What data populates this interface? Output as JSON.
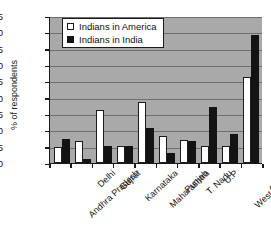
{
  "chart_data": {
    "type": "bar",
    "title": "",
    "xlabel": "",
    "ylabel": "% of respondents",
    "ylim": [
      0,
      45
    ],
    "ytick_step": 5,
    "yticks": [
      "45",
      "40",
      "35",
      "30",
      "25",
      "20",
      "15",
      "10",
      "5",
      "0"
    ],
    "grid": true,
    "legend_position": "top-left-inside",
    "categories": [
      "Andhra Pradesh",
      "Delhi",
      "Gujrat",
      "Karnataka",
      "Maharashtra",
      "Punjab",
      "T. Nadu",
      "U.P",
      "West Bengal",
      "Others"
    ],
    "series": [
      {
        "name": "Indians in America",
        "color": "#ffffff",
        "values": [
          5.0,
          6.8,
          16.3,
          5.2,
          18.8,
          8.3,
          7.0,
          5.3,
          5.2,
          26.2
        ]
      },
      {
        "name": "Indians in India",
        "color": "#131313",
        "values": [
          7.2,
          1.3,
          5.3,
          5.2,
          10.6,
          3.0,
          6.8,
          17.0,
          8.8,
          39.2
        ]
      }
    ]
  },
  "legend": {
    "items": [
      {
        "label": "Indians in America"
      },
      {
        "label": "Indians in India"
      }
    ]
  },
  "colors": {
    "plot_background": "#a9a9a9",
    "gridline": "#6e6e6e",
    "axis": "#1a1a1a",
    "series_america": "#ffffff",
    "series_india": "#131313"
  }
}
